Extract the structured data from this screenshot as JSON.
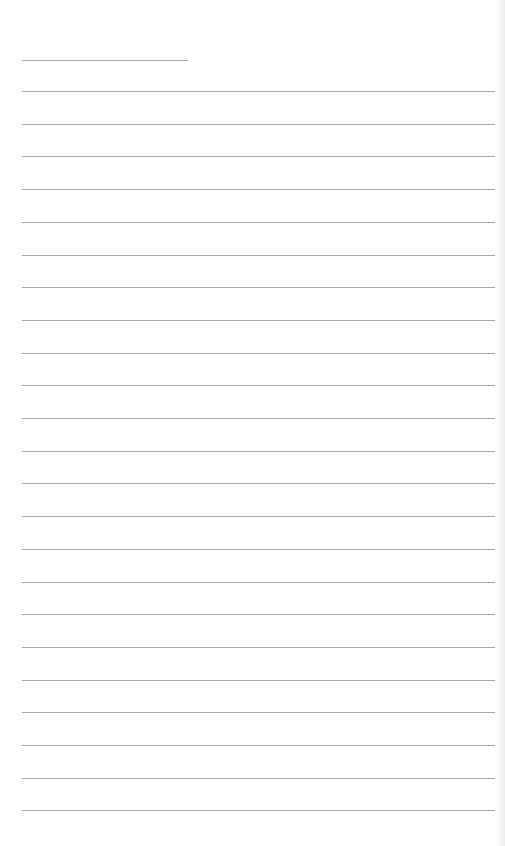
{
  "page": {
    "type": "blank lined sheet",
    "background_color": "#ffffff",
    "rule_color": "#a9a9a9",
    "header_line": {
      "x": 22,
      "y": 60,
      "width": 166
    },
    "ruled_lines": {
      "count": 23,
      "first_y": 91,
      "spacing": 32.7,
      "x_start": 22,
      "x_end": 495
    }
  }
}
